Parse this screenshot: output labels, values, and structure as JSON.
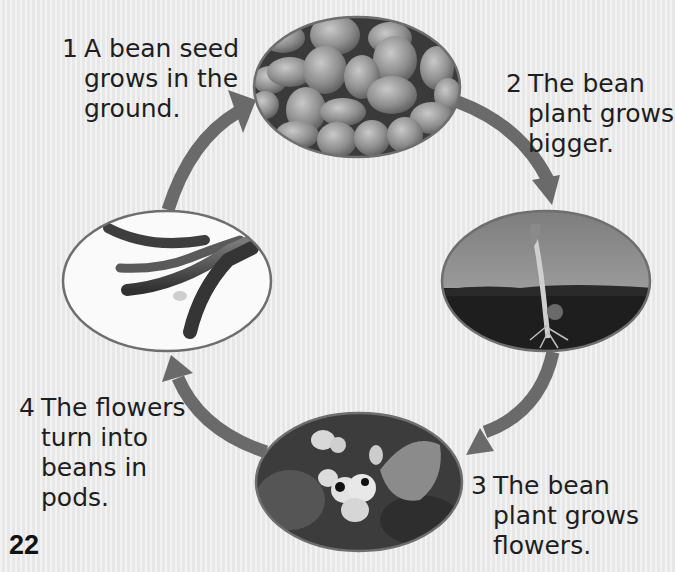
{
  "diagram": {
    "type": "life-cycle",
    "colors": {
      "background": "#ececec",
      "arrow": "#6a6a6a",
      "ellipse_border": "#6e6e6e",
      "text": "#1e1e1e"
    },
    "stages": [
      {
        "number": "1",
        "lines": [
          "A bean seed",
          "grows in the",
          "ground."
        ],
        "image": "bean-seeds-photo"
      },
      {
        "number": "2",
        "lines": [
          "The bean",
          "plant grows",
          "bigger."
        ],
        "image": "seedling-photo"
      },
      {
        "number": "3",
        "lines": [
          "The bean",
          "plant grows",
          "flowers."
        ],
        "image": "bean-flowers-photo"
      },
      {
        "number": "4",
        "lines": [
          "The flowers",
          "turn into",
          "beans in",
          "pods."
        ],
        "image": "bean-pods-photo"
      }
    ],
    "arrows": [
      {
        "from": "4",
        "to": "1",
        "name": "arrow-pods-to-seeds"
      },
      {
        "from": "1",
        "to": "2",
        "name": "arrow-seeds-to-seedling"
      },
      {
        "from": "2",
        "to": "3",
        "name": "arrow-seedling-to-flowers"
      },
      {
        "from": "3",
        "to": "4",
        "name": "arrow-flowers-to-pods"
      }
    ]
  },
  "page": {
    "number": "22"
  }
}
